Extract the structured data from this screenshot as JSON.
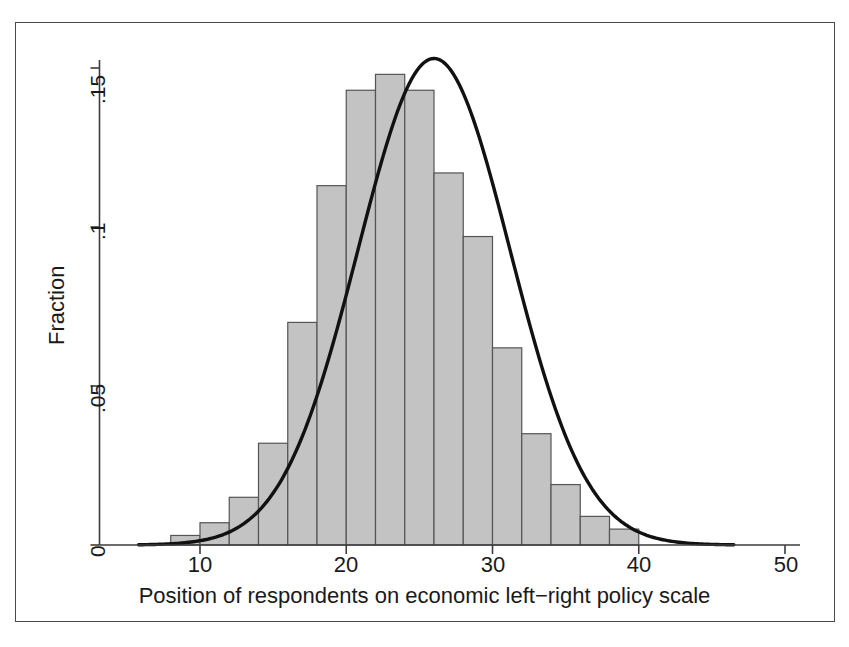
{
  "figure": {
    "background_color": "#ffffff",
    "frame_color": "#4a4a4a",
    "bar_fill_color": "#c3c3c3",
    "bar_edge_color": "#555555",
    "curve_color": "#111111",
    "axis_color": "#3c3c3c",
    "text_color": "#1a1a1a"
  },
  "axes": {
    "y_title": "Fraction",
    "x_title": "Position of respondents on economic left−right policy scale",
    "y_ticks": [
      "0",
      ".05",
      ".1",
      ".15"
    ],
    "x_ticks": [
      "10",
      "20",
      "30",
      "40",
      "50"
    ]
  },
  "chart_data": {
    "type": "bar",
    "title": "",
    "subtitle": "",
    "xlabel": "Position of respondents on economic left−right policy scale",
    "ylabel": "Fraction",
    "xlim": [
      5,
      50
    ],
    "ylim": [
      0,
      0.155
    ],
    "grid": false,
    "legend": null,
    "bin_width": 2,
    "x_tick_values": [
      10,
      20,
      30,
      40,
      50
    ],
    "y_tick_values": [
      0,
      0.05,
      0.1,
      0.15
    ],
    "y_tick_labels": [
      "0",
      ".05",
      ".1",
      ".15"
    ],
    "bin_starts": [
      6,
      8,
      10,
      12,
      14,
      16,
      18,
      20,
      22,
      24,
      26,
      28,
      30,
      32,
      34,
      36,
      38,
      40,
      42,
      44
    ],
    "bin_centers": [
      7,
      9,
      11,
      13,
      15,
      17,
      19,
      21,
      23,
      25,
      27,
      29,
      31,
      33,
      35,
      37,
      39,
      41,
      43,
      45
    ],
    "categories": [
      "6-8",
      "8-10",
      "10-12",
      "12-14",
      "14-16",
      "16-18",
      "18-20",
      "20-22",
      "22-24",
      "24-26",
      "26-28",
      "28-30",
      "30-32",
      "32-34",
      "34-36",
      "36-38",
      "38-40",
      "40-42",
      "42-44",
      "44-46"
    ],
    "values": [
      0.0,
      0.003,
      0.007,
      0.015,
      0.032,
      0.07,
      0.113,
      0.143,
      0.148,
      0.143,
      0.117,
      0.097,
      0.062,
      0.035,
      0.019,
      0.009,
      0.005,
      0.0,
      0.0,
      0.0
    ],
    "series": [
      {
        "name": "Fraction of respondents",
        "type": "bar",
        "values": [
          0.0,
          0.003,
          0.007,
          0.015,
          0.032,
          0.07,
          0.113,
          0.143,
          0.148,
          0.143,
          0.117,
          0.097,
          0.062,
          0.035,
          0.019,
          0.009,
          0.005,
          0.0,
          0.0,
          0.0
        ]
      },
      {
        "name": "Normal density overlay",
        "type": "line",
        "mean": 26.0,
        "sd": 5.2,
        "peak_value": 0.153,
        "x_start": 5.8,
        "x_end": 46.5
      }
    ]
  }
}
